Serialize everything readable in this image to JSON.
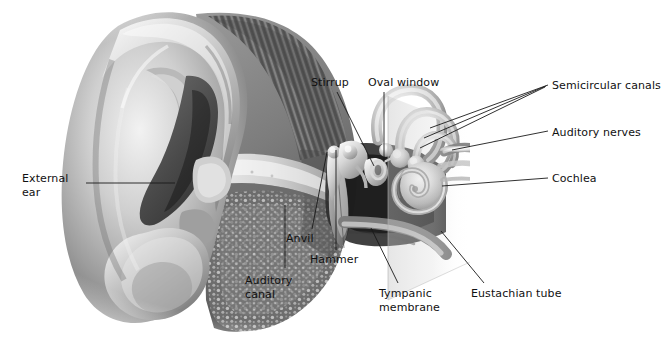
{
  "figure": {
    "style": "grayscale medical illustration, cutaway cross-section",
    "background_color": "#ffffff",
    "text_color": "#111111",
    "leader_color": "#1a1a1a"
  },
  "labels": [
    {
      "id": "external-ear",
      "lines": [
        "External",
        "ear"
      ],
      "x": 22,
      "y": 172,
      "align": "left",
      "leader": {
        "x1": 86,
        "y1": 183,
        "x2": 175,
        "y2": 183
      }
    },
    {
      "id": "auditory-canal",
      "lines": [
        "Auditory",
        "canal"
      ],
      "x": 245,
      "y": 274,
      "align": "left",
      "leader": {
        "x1": 285,
        "y1": 268,
        "x2": 285,
        "y2": 205
      }
    },
    {
      "id": "anvil",
      "lines": [
        "Anvil"
      ],
      "x": 286,
      "y": 232,
      "align": "left",
      "leader": {
        "x1": 312,
        "y1": 229,
        "x2": 327,
        "y2": 152
      }
    },
    {
      "id": "hammer",
      "lines": [
        "Hammer"
      ],
      "x": 310,
      "y": 253,
      "align": "left",
      "leader": {
        "x1": 336,
        "y1": 250,
        "x2": 336,
        "y2": 150
      }
    },
    {
      "id": "stirrup",
      "lines": [
        "Stirrup"
      ],
      "x": 311,
      "y": 76,
      "align": "left",
      "leader": {
        "x1": 337,
        "y1": 92,
        "x2": 374,
        "y2": 166
      }
    },
    {
      "id": "oval-window",
      "lines": [
        "Oval window"
      ],
      "x": 368,
      "y": 76,
      "align": "left",
      "leader": {
        "x1": 384,
        "y1": 92,
        "x2": 384,
        "y2": 162
      }
    },
    {
      "id": "tympanic-membrane",
      "lines": [
        "Tympanic",
        "membrane"
      ],
      "x": 379,
      "y": 287,
      "align": "left",
      "leader": {
        "x1": 398,
        "y1": 283,
        "x2": 371,
        "y2": 228
      }
    },
    {
      "id": "eustachian-tube",
      "lines": [
        "Eustachian tube"
      ],
      "x": 471,
      "y": 287,
      "align": "left",
      "leader": {
        "x1": 484,
        "y1": 283,
        "x2": 441,
        "y2": 231
      }
    },
    {
      "id": "semicircular-canals",
      "lines": [
        "Semicircular canals"
      ],
      "x": 552,
      "y": 79,
      "align": "left",
      "leader": {
        "x1": 548,
        "y1": 85,
        "x2": 430,
        "y2": 128
      },
      "extra_leaders": [
        {
          "x1": 546,
          "y1": 86,
          "x2": 424,
          "y2": 138
        },
        {
          "x1": 545,
          "y1": 87,
          "x2": 420,
          "y2": 148
        }
      ]
    },
    {
      "id": "auditory-nerves",
      "lines": [
        "Auditory nerves"
      ],
      "x": 552,
      "y": 126,
      "align": "left",
      "leader": {
        "x1": 548,
        "y1": 131,
        "x2": 452,
        "y2": 150
      }
    },
    {
      "id": "cochlea",
      "lines": [
        "Cochlea"
      ],
      "x": 552,
      "y": 172,
      "align": "left",
      "leader": {
        "x1": 548,
        "y1": 178,
        "x2": 442,
        "y2": 186
      }
    }
  ]
}
